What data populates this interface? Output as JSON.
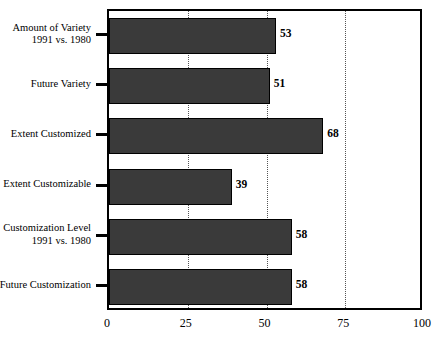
{
  "chart_data": {
    "type": "bar",
    "orientation": "horizontal",
    "title": "",
    "subtitle": "",
    "xlabel": "",
    "ylabel": "",
    "xlim": [
      0,
      100
    ],
    "xticks": [
      "0",
      "25",
      "50",
      "75",
      "100"
    ],
    "xtick_values": [
      0,
      25,
      50,
      75,
      100
    ],
    "grid": "vertical dotted at 25, 50, 75",
    "legend": "none",
    "categories": [
      "Amount of Variety\n1991 vs. 1980",
      "Future Variety",
      "Extent Customized",
      "Extent Customizable",
      "Customization Level\n1991 vs. 1980",
      "Future Customization"
    ],
    "values": [
      53,
      51,
      68,
      39,
      58,
      58
    ],
    "bar_color": "#3a3a3a",
    "bar_edge_color": "#000000",
    "background_color": "#ffffff"
  },
  "axis": {
    "x_ticks": [
      {
        "label": "0",
        "value": 0
      },
      {
        "label": "25",
        "value": 25
      },
      {
        "label": "50",
        "value": 50
      },
      {
        "label": "75",
        "value": 75
      },
      {
        "label": "100",
        "value": 100
      }
    ],
    "gridlines": [
      25,
      50,
      75
    ]
  },
  "bars": [
    {
      "label_line1": "Amount of Variety",
      "label_line2": "1991 vs. 1980",
      "value": 53,
      "value_label": "53"
    },
    {
      "label_line1": "Future Variety",
      "label_line2": "",
      "value": 51,
      "value_label": "51"
    },
    {
      "label_line1": "Extent Customized",
      "label_line2": "",
      "value": 68,
      "value_label": "68"
    },
    {
      "label_line1": "Extent Customizable",
      "label_line2": "",
      "value": 39,
      "value_label": "39"
    },
    {
      "label_line1": "Customization Level",
      "label_line2": "1991 vs. 1980",
      "value": 58,
      "value_label": "58"
    },
    {
      "label_line1": "Future Customization",
      "label_line2": "",
      "value": 58,
      "value_label": "58"
    }
  ]
}
